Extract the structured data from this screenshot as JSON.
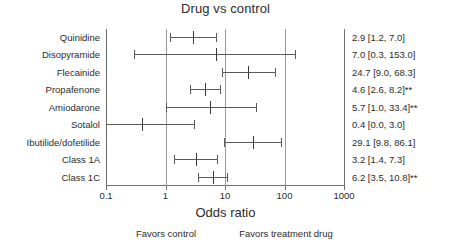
{
  "chart_data": {
    "type": "forest",
    "title": "Drug vs control",
    "xlabel": "Odds ratio",
    "ylabel": "",
    "xscale": "log",
    "xlim": [
      0.1,
      1000
    ],
    "xticks": [
      0.1,
      1,
      10,
      100,
      1000
    ],
    "xtick_labels": [
      "0.1",
      "1",
      "10",
      "100",
      "1000"
    ],
    "grid": true,
    "null_line": 1,
    "left_annotation": "Favors control",
    "right_annotation": "Favors treatment drug",
    "significance_marker": "**",
    "categories": [
      "Quinidine",
      "Disopyramide",
      "Flecainide",
      "Propafenone",
      "Amiodarone",
      "Sotalol",
      "Ibutilide/dofetilide",
      "Class 1A",
      "Class 1C"
    ],
    "rows": [
      {
        "label": "Quinidine",
        "estimate": 2.9,
        "ci_low": 1.2,
        "ci_high": 7.0,
        "text": "2.9 [1.2, 7.0]",
        "significant": false,
        "clipped_low": false,
        "clipped_high": false
      },
      {
        "label": "Disopyramide",
        "estimate": 7.0,
        "ci_low": 0.3,
        "ci_high": 153.0,
        "text": "7.0 [0.3, 153.0]",
        "significant": false,
        "clipped_low": false,
        "clipped_high": false
      },
      {
        "label": "Flecainide",
        "estimate": 24.7,
        "ci_low": 9.0,
        "ci_high": 68.3,
        "text": "24.7 [9.0, 68.3]",
        "significant": false,
        "clipped_low": false,
        "clipped_high": false
      },
      {
        "label": "Propafenone",
        "estimate": 4.6,
        "ci_low": 2.6,
        "ci_high": 8.2,
        "text": "4.6 [2.6, 8.2]**",
        "significant": true,
        "clipped_low": false,
        "clipped_high": false
      },
      {
        "label": "Amiodarone",
        "estimate": 5.7,
        "ci_low": 1.0,
        "ci_high": 33.4,
        "text": "5.7 [1.0, 33.4]**",
        "significant": true,
        "clipped_low": false,
        "clipped_high": false
      },
      {
        "label": "Sotalol",
        "estimate": 0.4,
        "ci_low": 0.1,
        "ci_high": 3.0,
        "text": "0.4 [0.0, 3.0]",
        "significant": false,
        "clipped_low": true,
        "clipped_high": false
      },
      {
        "label": "Ibutilide/dofetilide",
        "estimate": 29.1,
        "ci_low": 9.8,
        "ci_high": 86.1,
        "text": "29.1 [9.8, 86.1]",
        "significant": false,
        "clipped_low": false,
        "clipped_high": false
      },
      {
        "label": "Class 1A",
        "estimate": 3.2,
        "ci_low": 1.4,
        "ci_high": 7.3,
        "text": "3.2 [1.4, 7.3]",
        "significant": false,
        "clipped_low": false,
        "clipped_high": false
      },
      {
        "label": "Class 1C",
        "estimate": 6.2,
        "ci_low": 3.5,
        "ci_high": 10.8,
        "text": "6.2 [3.5, 10.8]**",
        "significant": true,
        "clipped_low": false,
        "clipped_high": false
      }
    ]
  },
  "colors": {
    "background": "#ffffff",
    "text": "#2b2b2b",
    "axis": "#6e6e6e",
    "gridline": "#9a9a9a",
    "ci_line": "#5a5a5a",
    "point": "#3a3a3a"
  }
}
